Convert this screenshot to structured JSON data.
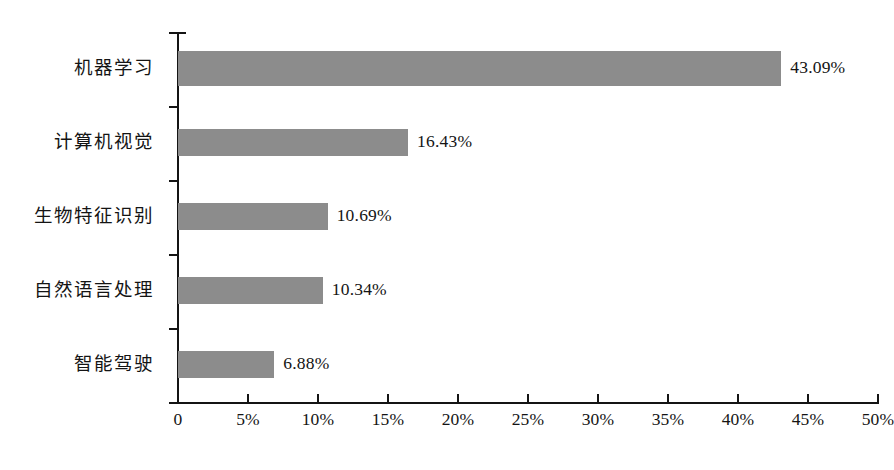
{
  "chart_data": {
    "type": "bar",
    "orientation": "horizontal",
    "title": "",
    "subtitle": "",
    "xlabel": "",
    "ylabel": "",
    "xlim": [
      0,
      50
    ],
    "grid": false,
    "legend": false,
    "bar_color": "#8c8c8c",
    "axis_color": "#141414",
    "categories": [
      "机器学习",
      "计算机视觉",
      "生物特征识别",
      "自然语言处理",
      "智能驾驶"
    ],
    "values": [
      43.09,
      16.43,
      10.69,
      10.34,
      6.88
    ],
    "data_labels": [
      "43.09%",
      "16.43%",
      "10.69%",
      "10.34%",
      "6.88%"
    ],
    "xticks": [
      0,
      5,
      10,
      15,
      20,
      25,
      30,
      35,
      40,
      45,
      50
    ],
    "xticklabels": [
      "0",
      "5%",
      "10%",
      "15%",
      "20%",
      "25%",
      "30%",
      "35%",
      "40%",
      "45%",
      "50%"
    ]
  }
}
